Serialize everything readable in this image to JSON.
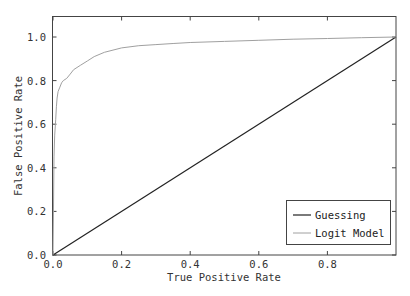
{
  "chart_data": {
    "type": "line",
    "title": "",
    "xlabel": "True Positive Rate",
    "ylabel": "False Positive Rate",
    "xlim": [
      0,
      1
    ],
    "ylim": [
      0,
      1.08
    ],
    "x_ticks": [
      0.0,
      0.2,
      0.4,
      0.6,
      0.8
    ],
    "x_tick_labels": [
      "0.0",
      "0.2",
      "0.4",
      "0.6",
      "0.8"
    ],
    "y_ticks": [
      0.0,
      0.2,
      0.4,
      0.6,
      0.8,
      1.0
    ],
    "y_tick_labels": [
      "0.0",
      "0.2",
      "0.4",
      "0.6",
      "0.8",
      "1.0"
    ],
    "grid": false,
    "legend_position": "lower right",
    "series": [
      {
        "name": "Guessing",
        "color": "#222222",
        "x": [
          0.0,
          1.0
        ],
        "y": [
          0.0,
          1.0
        ]
      },
      {
        "name": "Logit Model",
        "color": "#a0a0a0",
        "x": [
          0.0,
          0.003,
          0.005,
          0.008,
          0.01,
          0.012,
          0.015,
          0.02,
          0.025,
          0.03,
          0.04,
          0.05,
          0.06,
          0.08,
          0.1,
          0.12,
          0.15,
          0.2,
          0.25,
          0.3,
          0.35,
          0.4,
          0.5,
          0.6,
          0.7,
          0.8,
          0.9,
          1.0
        ],
        "y": [
          0.0,
          0.45,
          0.55,
          0.62,
          0.68,
          0.72,
          0.75,
          0.77,
          0.79,
          0.8,
          0.81,
          0.83,
          0.85,
          0.87,
          0.89,
          0.91,
          0.93,
          0.95,
          0.96,
          0.965,
          0.97,
          0.975,
          0.98,
          0.985,
          0.99,
          0.993,
          0.997,
          1.0
        ]
      }
    ]
  },
  "legend": {
    "items": [
      {
        "label": "Guessing",
        "color": "#222222"
      },
      {
        "label": "Logit Model",
        "color": "#a0a0a0"
      }
    ]
  }
}
